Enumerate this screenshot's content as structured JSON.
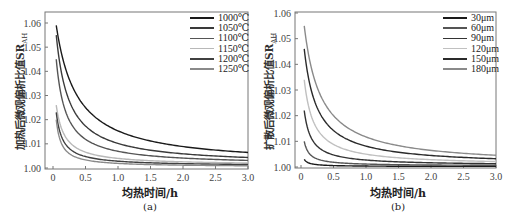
{
  "chart_data": [
    {
      "id": "a",
      "type": "line",
      "caption": "(a)",
      "title": "",
      "xlabel": "均热时间/h",
      "ylabel": "加热后微观偏析比值SR",
      "ylabel_sub": "AH",
      "xlim": [
        0,
        3.0
      ],
      "ylim": [
        0.999,
        1.065
      ],
      "xticks": [
        "0",
        "0.5",
        "1.0",
        "1.5",
        "2.0",
        "2.5",
        "3.0"
      ],
      "yticks": [
        "1.00",
        "1.01",
        "1.02",
        "1.03",
        "1.04",
        "1.05",
        "1.06"
      ],
      "grid": false,
      "legend_position": "upper right",
      "x_start": 0.05,
      "series": [
        {
          "name": "1000℃",
          "color": "#1a1a1a",
          "start": 1.059,
          "end": 1.0028,
          "k": 0.33
        },
        {
          "name": "1050℃",
          "color": "#3a3a3a",
          "start": 1.055,
          "end": 1.0022,
          "k": 0.2
        },
        {
          "name": "1100℃",
          "color": "#555555",
          "start": 1.045,
          "end": 1.0018,
          "k": 0.15
        },
        {
          "name": "1150℃",
          "color": "#b8b8b8",
          "start": 1.026,
          "end": 1.0014,
          "k": 0.13
        },
        {
          "name": "1200℃",
          "color": "#404040",
          "start": 1.023,
          "end": 1.001,
          "k": 0.1
        },
        {
          "name": "1250℃",
          "color": "#8a8a8a",
          "start": 1.02,
          "end": 1.0006,
          "k": 0.08
        }
      ]
    },
    {
      "id": "b",
      "type": "line",
      "caption": "(b)",
      "title": "",
      "xlabel": "均热时间/h",
      "ylabel": "扩散后微观偏析比值SR",
      "ylabel_sub": "AH",
      "xlim": [
        0,
        3.0
      ],
      "ylim": [
        0.999,
        1.06
      ],
      "xticks": [
        "0",
        "0.5",
        "1.0",
        "1.5",
        "2.0",
        "2.5",
        "3.0"
      ],
      "yticks": [
        "1.00",
        "1.01",
        "1.02",
        "1.03",
        "1.04",
        "1.05",
        "1.06"
      ],
      "grid": false,
      "legend_position": "upper right",
      "x_start": 0.05,
      "series": [
        {
          "name": "30μm",
          "color": "#1a1a1a",
          "start": 1.003,
          "end": 1.0002,
          "k": 0.07
        },
        {
          "name": "60μm",
          "color": "#555555",
          "start": 1.01,
          "end": 1.0005,
          "k": 0.08
        },
        {
          "name": "90μm",
          "color": "#333333",
          "start": 1.022,
          "end": 1.0008,
          "k": 0.11
        },
        {
          "name": "120μm",
          "color": "#c0c0c0",
          "start": 1.034,
          "end": 1.0011,
          "k": 0.15
        },
        {
          "name": "150μm",
          "color": "#2a2a2a",
          "start": 1.046,
          "end": 1.0014,
          "k": 0.2
        },
        {
          "name": "180μm",
          "color": "#8a8a8a",
          "start": 1.055,
          "end": 1.0018,
          "k": 0.26
        }
      ]
    }
  ]
}
